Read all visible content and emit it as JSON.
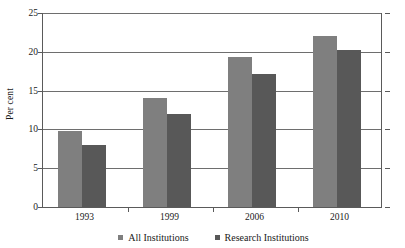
{
  "chart_data": {
    "type": "bar",
    "title": "",
    "subtitle": "",
    "xlabel": "",
    "ylabel": "Per cent",
    "categories": [
      "1993",
      "1999",
      "2006",
      "2010"
    ],
    "series": [
      {
        "name": "All Institutions",
        "color": "#7f7f7f",
        "values": [
          9.8,
          14.0,
          19.3,
          22.0
        ]
      },
      {
        "name": "Research Institutions",
        "color": "#585858",
        "values": [
          8.0,
          12.0,
          17.2,
          20.2
        ]
      }
    ],
    "ylim": [
      0,
      25
    ],
    "ytick_step": 5,
    "yticks": [
      "0",
      "5",
      "10",
      "15",
      "20",
      "25"
    ],
    "grid": true,
    "legend_position": "bottom",
    "annotations": []
  }
}
